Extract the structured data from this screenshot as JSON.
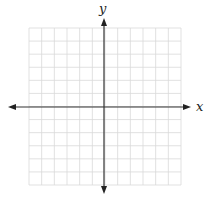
{
  "diagram": {
    "type": "coordinate-plane",
    "x_axis_label": "x",
    "y_axis_label": "y",
    "grid": {
      "columns": 12,
      "rows": 12,
      "left": 29,
      "top": 28,
      "right": 181,
      "bottom": 185,
      "color": "#d9d9d9"
    },
    "axes": {
      "color": "#333333",
      "origin_x": 104,
      "origin_y": 107,
      "x_start": 8,
      "x_end": 191,
      "y_start": 18,
      "y_end": 194
    }
  }
}
